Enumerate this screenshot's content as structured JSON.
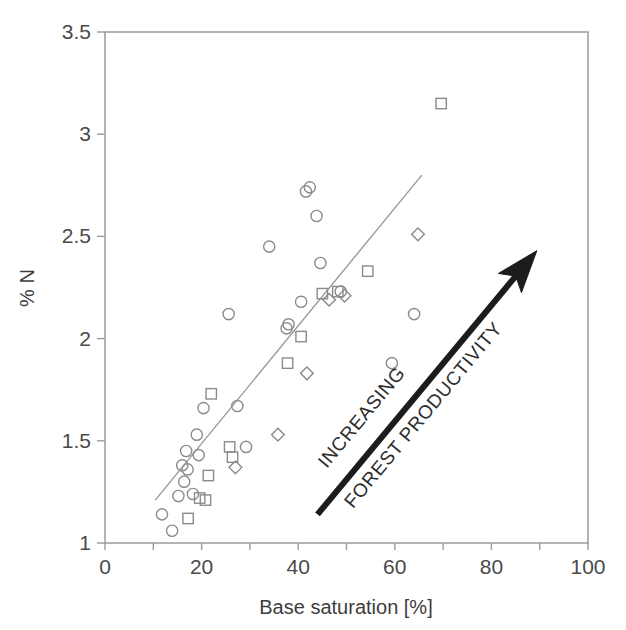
{
  "chart_data": {
    "type": "scatter",
    "title": "",
    "xlabel": "Base saturation [%]",
    "ylabel": "% N",
    "xlim": [
      0,
      100
    ],
    "ylim": [
      1,
      3.5
    ],
    "xticks": [
      0,
      10,
      20,
      30,
      40,
      50,
      60,
      70,
      80,
      90,
      100
    ],
    "xtick_labels": [
      "0",
      "",
      "20",
      "",
      "40",
      "",
      "60",
      "",
      "80",
      "",
      "100"
    ],
    "yticks": [
      1,
      1.5,
      2,
      2.5,
      3,
      3.5
    ],
    "ytick_labels": [
      "1",
      "1.5",
      "2",
      "2.5",
      "3",
      "3.5"
    ],
    "grid": false,
    "legend": null,
    "series": [
      {
        "name": "circles",
        "marker": "circle",
        "points": [
          [
            11.8,
            1.14
          ],
          [
            13.9,
            1.06
          ],
          [
            15.2,
            1.23
          ],
          [
            16.0,
            1.38
          ],
          [
            16.4,
            1.3
          ],
          [
            16.8,
            1.45
          ],
          [
            17.1,
            1.36
          ],
          [
            18.2,
            1.24
          ],
          [
            19.0,
            1.53
          ],
          [
            19.4,
            1.43
          ],
          [
            20.4,
            1.66
          ],
          [
            25.6,
            2.12
          ],
          [
            27.4,
            1.67
          ],
          [
            29.2,
            1.47
          ],
          [
            34.0,
            2.45
          ],
          [
            37.6,
            2.05
          ],
          [
            38.0,
            2.07
          ],
          [
            40.6,
            2.18
          ],
          [
            41.6,
            2.72
          ],
          [
            42.4,
            2.74
          ],
          [
            43.8,
            2.6
          ],
          [
            44.6,
            2.37
          ],
          [
            48.8,
            2.23
          ],
          [
            59.4,
            1.88
          ],
          [
            64.0,
            2.12
          ]
        ]
      },
      {
        "name": "squares",
        "marker": "square",
        "points": [
          [
            17.2,
            1.12
          ],
          [
            19.6,
            1.22
          ],
          [
            20.8,
            1.21
          ],
          [
            21.4,
            1.33
          ],
          [
            22.0,
            1.73
          ],
          [
            25.8,
            1.47
          ],
          [
            26.4,
            1.42
          ],
          [
            37.8,
            1.88
          ],
          [
            40.6,
            2.01
          ],
          [
            45.0,
            2.22
          ],
          [
            48.2,
            2.23
          ],
          [
            54.4,
            2.33
          ],
          [
            69.6,
            3.15
          ]
        ]
      },
      {
        "name": "diamonds",
        "marker": "diamond",
        "points": [
          [
            27.0,
            1.37
          ],
          [
            35.8,
            1.53
          ],
          [
            41.8,
            1.83
          ],
          [
            46.4,
            2.19
          ],
          [
            49.6,
            2.21
          ],
          [
            64.8,
            2.51
          ]
        ]
      }
    ],
    "trend_line": {
      "name": "regression-line",
      "x_start": 10.4,
      "y_start": 1.21,
      "x_end": 65.6,
      "y_end": 2.8
    },
    "annotation_arrow": {
      "name": "forest-productivity-arrow",
      "x_start": 44.0,
      "y_start": 1.14,
      "x_end": 89.4,
      "y_end": 2.43,
      "color": "#1c1c1c"
    }
  },
  "annotations": {
    "increasing_label": "INCREASING",
    "productivity_label": "FOREST PRODUCTIVITY"
  },
  "colors": {
    "axis": "#9a9a9a",
    "marker_stroke": "#8b8b8b",
    "text": "#3a3a3a",
    "arrow": "#1c1c1c"
  }
}
